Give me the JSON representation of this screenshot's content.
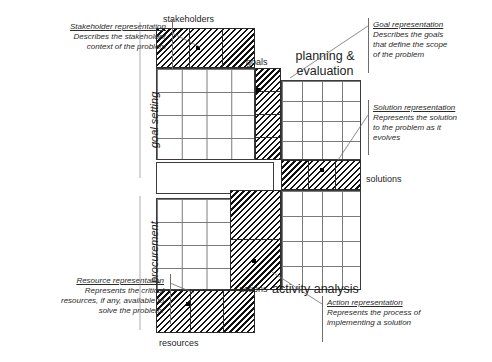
{
  "diagram": {
    "axis_labels": {
      "goal_setting": "goal setting",
      "procurement": "procurement"
    },
    "quadrant_labels": {
      "planning_evaluation": "planning &\nevaluation",
      "activity_analysis": "activity analysis"
    },
    "strip_labels": {
      "stakeholders": "stakeholders",
      "goals": "goals",
      "solutions": "solutions",
      "actions": "actions",
      "resources": "resources"
    },
    "annotations": [
      {
        "id": "stakeholder",
        "title": "Stakeholder representation",
        "lines": [
          "Describes the stakeholder",
          "context of the problem"
        ],
        "align": "right"
      },
      {
        "id": "goal",
        "title": "Goal representation",
        "lines": [
          "Describes the goals",
          "that define the scope",
          "of the problem"
        ],
        "align": "left"
      },
      {
        "id": "solution",
        "title": "Solution representation",
        "lines": [
          "Represents the solution",
          "to the problem as it",
          "evolves"
        ],
        "align": "left"
      },
      {
        "id": "resource",
        "title": "Resource representation",
        "lines": [
          "Represents the critical",
          "resources, if any, available to",
          "solve the problem."
        ],
        "align": "right"
      },
      {
        "id": "action",
        "title": "Action representation",
        "lines": [
          "Represents the process of",
          "implementing a solution"
        ],
        "align": "left"
      }
    ],
    "colors": {
      "ink": "#1d1d1d",
      "grid_line": "#7a7a7a",
      "block_border": "#3b3b3b",
      "hatch": "#111111",
      "background": "#ffffff",
      "leader_line": "#6e6e6e"
    }
  }
}
